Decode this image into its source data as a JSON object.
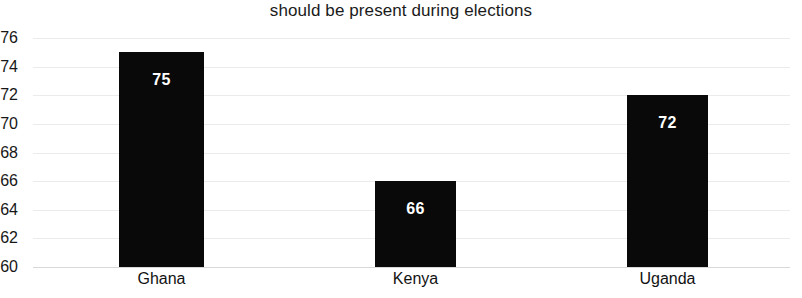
{
  "chart_data": {
    "type": "bar",
    "title": "should be present during elections",
    "xlabel": "",
    "ylabel": "",
    "categories": [
      "Ghana",
      "Kenya",
      "Uganda"
    ],
    "values": [
      75,
      66,
      72
    ],
    "value_labels": [
      "75",
      "66",
      "72"
    ],
    "ylim": [
      60,
      76
    ],
    "ytick_labels": [
      "76",
      "74",
      "72",
      "70",
      "68",
      "66",
      "64",
      "62",
      "60"
    ],
    "ytick_values": [
      76,
      74,
      72,
      70,
      68,
      66,
      64,
      62,
      60
    ],
    "grid": true,
    "grid_axis": "y",
    "legend": null,
    "bar_color": "#090909",
    "value_label_color": "#ffffff",
    "grid_color": "#ebebeb",
    "background_color": "#ffffff"
  }
}
